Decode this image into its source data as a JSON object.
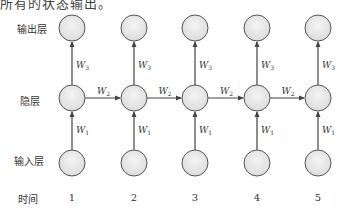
{
  "caption_fragment": "所有的状态输出。",
  "row_labels": {
    "output": "输出层",
    "hidden": "隐层",
    "input": "输入层",
    "time": "时间"
  },
  "weights": {
    "input_to_hidden": "W1",
    "hidden_to_hidden": "W2",
    "hidden_to_output": "W3"
  },
  "time_steps": [
    "1",
    "2",
    "3",
    "4",
    "5"
  ],
  "colors": {
    "node_fill": "#e8e8e8",
    "node_stroke": "#555555",
    "edge": "#444444"
  }
}
